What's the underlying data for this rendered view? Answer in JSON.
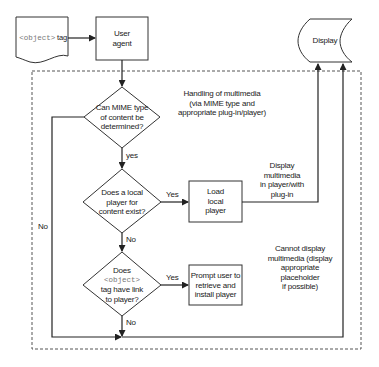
{
  "nodes": {
    "object_tag": {
      "code": "<object>",
      "text": " tag"
    },
    "user_agent": {
      "line1": "User",
      "line2": "agent"
    },
    "display": {
      "label": "Display"
    },
    "decision_mime": {
      "line1": "Can MIME type",
      "line2": "of content be",
      "line3": "determined?"
    },
    "decision_local_player": {
      "line1": "Does a local",
      "line2": "player for",
      "line3": "content exist?"
    },
    "decision_link": {
      "line1": "Does",
      "code": "<object>",
      "line3": "tag have link",
      "line4": "to player?"
    },
    "load_local_player": {
      "line1": "Load",
      "line2": "local",
      "line3": "player"
    },
    "prompt_user": {
      "line1": "Prompt user to",
      "line2": "retrieve and",
      "line3": "install player"
    }
  },
  "annotations": {
    "handling": {
      "line1": "Handling of multimedia",
      "line2": "(via MIME type and",
      "line3": "appropriate plug-in/player)"
    },
    "display_multimedia": {
      "line1": "Display",
      "line2": "multimedia",
      "line3": "in player/with",
      "line4": "plug-in"
    },
    "cannot_display": {
      "line1": "Cannot display",
      "line2": "multimedia (display",
      "line3": "appropriate placeholder",
      "line4": "if possible)"
    }
  },
  "edge_labels": {
    "mime_yes": "yes",
    "mime_no": "No",
    "local_yes": "Yes",
    "local_no": "No",
    "link_yes": "Yes",
    "link_no": "No"
  },
  "colors": {
    "stroke": "#333333",
    "dashed": "#555555",
    "code": "#777777"
  }
}
